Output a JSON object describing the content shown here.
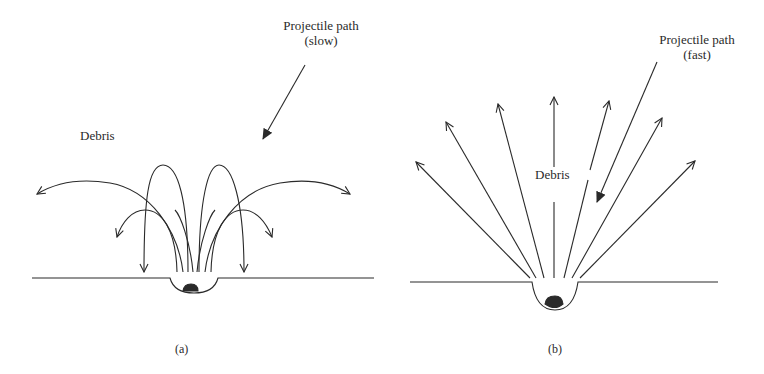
{
  "panel_a": {
    "caption": "(a)",
    "debris_label": "Debris",
    "projectile_label_line1": "Projectile path",
    "projectile_label_line2": "(slow)"
  },
  "panel_b": {
    "caption": "(b)",
    "debris_label": "Debris",
    "projectile_label_line1": "Projectile path",
    "projectile_label_line2": "(fast)"
  },
  "colors": {
    "line": "#2a2a2a",
    "background": "#ffffff"
  }
}
